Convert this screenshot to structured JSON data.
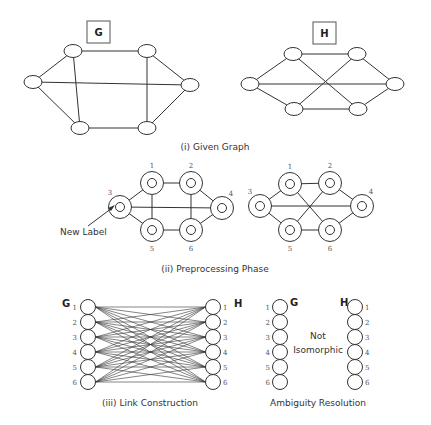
{
  "panel_i": {
    "caption": "(i) Given Graph",
    "graph_g": {
      "label": "G",
      "nodes": [
        [
          33,
          82
        ],
        [
          73,
          51
        ],
        [
          147,
          51
        ],
        [
          190,
          85
        ],
        [
          80,
          128
        ],
        [
          147,
          128
        ]
      ],
      "edges": [
        [
          0,
          1
        ],
        [
          0,
          4
        ],
        [
          1,
          2
        ],
        [
          1,
          4
        ],
        [
          2,
          3
        ],
        [
          2,
          5
        ],
        [
          3,
          5
        ],
        [
          4,
          5
        ],
        [
          0,
          3
        ]
      ]
    },
    "graph_h": {
      "label": "H",
      "nodes": [
        [
          250,
          84
        ],
        [
          293,
          54
        ],
        [
          357,
          54
        ],
        [
          395,
          84
        ],
        [
          294,
          109
        ],
        [
          358,
          109
        ]
      ],
      "edges": [
        [
          0,
          1
        ],
        [
          0,
          4
        ],
        [
          1,
          2
        ],
        [
          2,
          3
        ],
        [
          3,
          5
        ],
        [
          4,
          5
        ],
        [
          1,
          5
        ],
        [
          2,
          4
        ],
        [
          0,
          3
        ]
      ]
    }
  },
  "panel_ii": {
    "caption": "(ii) Preprocessing Phase",
    "annotation": "New Label",
    "graph_g": {
      "node_labels": [
        "1",
        "2",
        "3",
        "4",
        "5",
        "6"
      ],
      "nodes": [
        [
          152,
          183
        ],
        [
          191,
          183
        ],
        [
          120,
          207
        ],
        [
          222,
          208
        ],
        [
          152,
          230
        ],
        [
          191,
          230
        ]
      ],
      "edges": [
        [
          0,
          1
        ],
        [
          0,
          2
        ],
        [
          0,
          4
        ],
        [
          1,
          3
        ],
        [
          1,
          5
        ],
        [
          2,
          4
        ],
        [
          3,
          5
        ],
        [
          4,
          5
        ],
        [
          2,
          3
        ]
      ]
    },
    "graph_h": {
      "node_labels": [
        "1",
        "2",
        "3",
        "4",
        "5",
        "6"
      ],
      "nodes": [
        [
          290,
          184
        ],
        [
          330,
          183
        ],
        [
          260,
          206
        ],
        [
          362,
          206
        ],
        [
          290,
          230
        ],
        [
          330,
          230
        ]
      ],
      "edges": [
        [
          0,
          1
        ],
        [
          0,
          2
        ],
        [
          1,
          3
        ],
        [
          2,
          4
        ],
        [
          3,
          5
        ],
        [
          4,
          5
        ],
        [
          0,
          5
        ],
        [
          1,
          4
        ],
        [
          2,
          3
        ]
      ]
    }
  },
  "panel_iii": {
    "caption": "(iii) Link Construction",
    "left_label": "G",
    "right_label": "H",
    "node_labels": [
      "1",
      "2",
      "3",
      "4",
      "5",
      "6"
    ]
  },
  "panel_iv": {
    "caption": "Ambiguity Resolution",
    "left_label": "G",
    "right_label": "H",
    "result_line1": "Not",
    "result_line2": "Isomorphic",
    "node_labels": [
      "1",
      "2",
      "3",
      "4",
      "5",
      "6"
    ]
  }
}
